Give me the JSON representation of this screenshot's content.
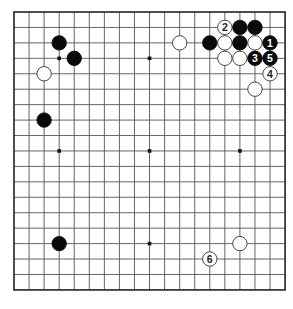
{
  "board": {
    "size": 19,
    "origin_x": 14,
    "origin_y": 12,
    "step_x": 15.06,
    "step_y": 15.44,
    "line_color": "#555555",
    "border_color": "#222222",
    "star_points": [
      [
        3,
        3
      ],
      [
        9,
        3
      ],
      [
        15,
        3
      ],
      [
        3,
        9
      ],
      [
        9,
        9
      ],
      [
        15,
        9
      ],
      [
        3,
        15
      ],
      [
        9,
        15
      ],
      [
        15,
        15
      ]
    ]
  },
  "stones": [
    {
      "color": "black",
      "col": 3,
      "row": 2,
      "label": ""
    },
    {
      "color": "black",
      "col": 4,
      "row": 3,
      "label": ""
    },
    {
      "color": "white",
      "col": 2,
      "row": 4,
      "label": ""
    },
    {
      "color": "black",
      "col": 2,
      "row": 7,
      "label": ""
    },
    {
      "color": "black",
      "col": 3,
      "row": 15,
      "label": ""
    },
    {
      "color": "white",
      "col": 11,
      "row": 2,
      "label": ""
    },
    {
      "color": "black",
      "col": 13,
      "row": 2,
      "label": ""
    },
    {
      "color": "white",
      "col": 14,
      "row": 1,
      "label": "2"
    },
    {
      "color": "black",
      "col": 15,
      "row": 1,
      "label": ""
    },
    {
      "color": "black",
      "col": 16,
      "row": 1,
      "label": ""
    },
    {
      "color": "white",
      "col": 14,
      "row": 2,
      "label": ""
    },
    {
      "color": "black",
      "col": 15,
      "row": 2,
      "label": ""
    },
    {
      "color": "white",
      "col": 16,
      "row": 2,
      "label": ""
    },
    {
      "color": "black",
      "col": 17,
      "row": 2,
      "label": "1"
    },
    {
      "color": "white",
      "col": 14,
      "row": 3,
      "label": ""
    },
    {
      "color": "white",
      "col": 15,
      "row": 3,
      "label": ""
    },
    {
      "color": "black",
      "col": 16,
      "row": 3,
      "label": "3"
    },
    {
      "color": "black",
      "col": 17,
      "row": 3,
      "label": "5"
    },
    {
      "color": "white",
      "col": 17,
      "row": 4,
      "label": "4"
    },
    {
      "color": "white",
      "col": 16,
      "row": 5,
      "label": ""
    },
    {
      "color": "white",
      "col": 15,
      "row": 15,
      "label": ""
    },
    {
      "color": "white",
      "col": 13,
      "row": 16,
      "label": "6"
    }
  ]
}
